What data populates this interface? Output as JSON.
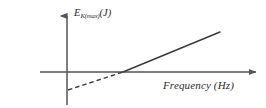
{
  "figure": {
    "name": "photoelectric-effect-graph",
    "background_color": "#ffffff",
    "line_color": "#3a3a3a",
    "axis_color": "#555555",
    "text_color": "#2b2b2b",
    "width": 266,
    "height": 108
  },
  "labels": {
    "y_axis_symbol": "E",
    "y_axis_subscript": "K(max)",
    "y_axis_unit": "(J)",
    "x_axis": "Frequency (Hz)"
  },
  "chart_data": {
    "type": "line",
    "title": "",
    "subtitle": "",
    "xlabel": "Frequency (Hz)",
    "ylabel": "E K(max) (J)",
    "grid": false,
    "legend": null,
    "axes": {
      "x_axis_y_px": 72,
      "y_axis_x_px": 67,
      "x_axis_start_px": 40,
      "x_axis_end_px": 258,
      "y_axis_top_px": 14,
      "y_axis_bottom_px": 105,
      "x_arrow": true,
      "y_arrow": true,
      "tick_labels_x": [],
      "tick_labels_y": []
    },
    "series": [
      {
        "name": "max kinetic energy vs frequency",
        "style": "straight-line",
        "segments": [
          {
            "name": "extrapolated-below-threshold",
            "dash": true,
            "points": [
              [
                68,
                90
              ],
              [
                123,
                72
              ]
            ]
          },
          {
            "name": "above-threshold",
            "dash": false,
            "points": [
              [
                123,
                72
              ],
              [
                220,
                32
              ]
            ]
          }
        ],
        "x_intercept_px": [
          123,
          72
        ],
        "y_intercept_px": [
          68,
          90
        ],
        "slope_sign": "positive"
      }
    ],
    "annotations": [
      {
        "name": "threshold-frequency-crossing",
        "description": "line crosses the frequency axis; dashed extrapolation below",
        "x_px": 123,
        "y_px": 72
      }
    ]
  }
}
